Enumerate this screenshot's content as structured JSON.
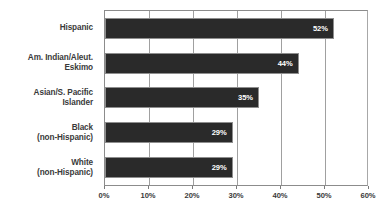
{
  "chart_data": {
    "type": "bar",
    "orientation": "horizontal",
    "title": "",
    "subtitle": "",
    "xlabel": "",
    "ylabel": "",
    "categories": [
      "Hispanic",
      "Am. Indian/Aleut.\nEskimo",
      "Asian/S. Pacific\nIslander",
      "Black\n(non-Hispanic)",
      "White\n(non-Hispanic)"
    ],
    "values": [
      52,
      44,
      35,
      29,
      29
    ],
    "value_labels": [
      "52%",
      "44%",
      "35%",
      "29%",
      "29%"
    ],
    "xlim": [
      0,
      60
    ],
    "xticks": [
      0,
      10,
      20,
      30,
      40,
      50,
      60
    ],
    "xtick_labels": [
      "0%",
      "10%",
      "20%",
      "30%",
      "40%",
      "50%",
      "60%"
    ],
    "grid": true,
    "grid_axis": "x",
    "legend": false,
    "legend_position": "none",
    "bar_color": "#2a2a2a",
    "bar_border_color": "#8e8e8e",
    "value_label_color": "#ffffff",
    "category_label_color": "#3a3a3a",
    "tick_label_color": "#3a3a3a",
    "gridline_color": "#a0a0a0",
    "plot_border_color": "#8c8c8c",
    "background_color": "#ffffff"
  }
}
